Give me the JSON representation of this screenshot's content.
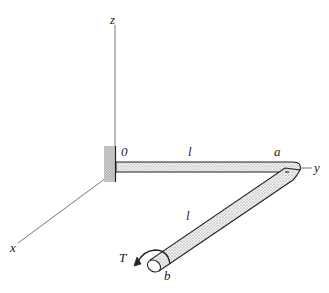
{
  "diagram": {
    "axes": {
      "x_label": "x",
      "y_label": "y",
      "z_label": "z"
    },
    "points": {
      "origin_label": "0",
      "corner_label": "a",
      "end_label": "b"
    },
    "segments": {
      "segment1_length_label": "l",
      "segment2_length_label": "l"
    },
    "load": {
      "torque_label": "T"
    },
    "colors": {
      "line": "#222222",
      "axis": "#666666",
      "stipple": "#888888",
      "background": "#ffffff"
    }
  }
}
